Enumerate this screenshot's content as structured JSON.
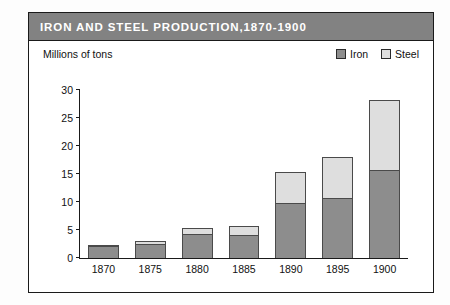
{
  "source_credit": {
    "label": "Source: ",
    "title": "Historical Statistics of the United States"
  },
  "panel": {
    "title": "IRON  AND  STEEL  PRODUCTION,1870-1900"
  },
  "colors": {
    "titlebar_bg": "#828282",
    "titlebar_text": "#ffffff",
    "iron": "#8d8d8d",
    "steel": "#dedede",
    "outline": "#1a1a1a"
  },
  "chart_data": {
    "type": "bar",
    "title": "IRON  AND  STEEL  PRODUCTION,1870-1900",
    "subtitle": "",
    "xlabel": "",
    "ylabel": "Millions of tons",
    "stacked": true,
    "grid": false,
    "legend_position": "top-right",
    "ylim": [
      0,
      30
    ],
    "yticks": [
      0,
      5,
      10,
      15,
      20,
      25,
      30
    ],
    "categories": [
      "1870",
      "1875",
      "1880",
      "1885",
      "1890",
      "1895",
      "1900"
    ],
    "series": [
      {
        "name": "Iron",
        "color": "#8d8d8d",
        "values": [
          2.2,
          2.5,
          4.3,
          4.1,
          9.8,
          10.7,
          15.7
        ]
      },
      {
        "name": "Steel",
        "color": "#dedede",
        "values": [
          0.1,
          0.6,
          1.0,
          1.6,
          5.6,
          7.3,
          12.5
        ]
      }
    ],
    "totals": [
      2.3,
      3.1,
      5.3,
      5.7,
      15.4,
      18.0,
      28.2
    ]
  }
}
